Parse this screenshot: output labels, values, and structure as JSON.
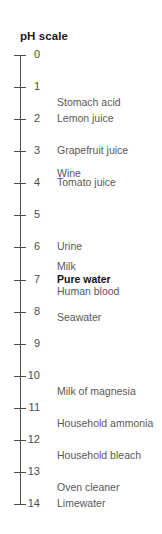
{
  "chart_data": {
    "type": "table",
    "title": "pH scale",
    "ylabel": "pH",
    "axis_range": [
      0,
      14
    ],
    "grid": false,
    "legend": "none",
    "tick_values": [
      0,
      1,
      2,
      3,
      4,
      5,
      6,
      7,
      8,
      9,
      10,
      11,
      12,
      13,
      14
    ],
    "tick_labels": [
      "0",
      "1",
      "2",
      "3",
      "4",
      "5",
      "6",
      "7",
      "8",
      "9",
      "10",
      "11",
      "12",
      "13",
      "14"
    ],
    "categories": [
      "Stomach acid",
      "Lemon juice",
      "Grapefruit juice",
      "Wine",
      "Tomato juice",
      "Urine",
      "Milk",
      "Pure water",
      "Human blood",
      "Seawater",
      "Milk of magnesia",
      "Household ammonia",
      "Household bleach",
      "Oven cleaner",
      "Limewater"
    ],
    "values": [
      1.5,
      2.0,
      3.0,
      3.7,
      4.0,
      6.0,
      6.6,
      7.0,
      7.4,
      8.2,
      10.5,
      11.5,
      12.5,
      13.5,
      14.0
    ],
    "emphasized": [
      "Pure water"
    ]
  },
  "axis": {
    "ticks": [
      {
        "label": "0",
        "value": 0
      },
      {
        "label": "1",
        "value": 1
      },
      {
        "label": "2",
        "value": 2
      },
      {
        "label": "3",
        "value": 3
      },
      {
        "label": "4",
        "value": 4
      },
      {
        "label": "5",
        "value": 5
      },
      {
        "label": "6",
        "value": 6
      },
      {
        "label": "7",
        "value": 7
      },
      {
        "label": "8",
        "value": 8
      },
      {
        "label": "9",
        "value": 9
      },
      {
        "label": "10",
        "value": 10
      },
      {
        "label": "11",
        "value": 11
      },
      {
        "label": "12",
        "value": 12
      },
      {
        "label": "13",
        "value": 13
      },
      {
        "label": "14",
        "value": 14
      }
    ]
  },
  "labels": [
    {
      "text": "Stomach acid",
      "value": 1.5,
      "bold": false
    },
    {
      "text": "Lemon juice",
      "value": 2.0,
      "bold": false
    },
    {
      "text": "Grapefruit juice",
      "value": 3.0,
      "bold": false
    },
    {
      "text": "Wine",
      "value": 3.7,
      "bold": false
    },
    {
      "text": "Tomato juice",
      "value": 4.0,
      "bold": false
    },
    {
      "text": "Urine",
      "value": 6.0,
      "bold": false
    },
    {
      "text": "Milk",
      "value": 6.62,
      "bold": false
    },
    {
      "text": "Pure water",
      "value": 7.0,
      "bold": true
    },
    {
      "text": "Human blood",
      "value": 7.4,
      "bold": false
    },
    {
      "text": "Seawater",
      "value": 8.2,
      "bold": false
    },
    {
      "text": "Milk of magnesia",
      "value": 10.5,
      "bold": false
    },
    {
      "text": "Household ammonia",
      "value": 11.5,
      "bold": false
    },
    {
      "text": "Household bleach",
      "value": 12.5,
      "bold": false
    },
    {
      "text": "Oven cleaner",
      "value": 13.5,
      "bold": false
    },
    {
      "text": "Limewater",
      "value": 14.0,
      "bold": false
    }
  ]
}
